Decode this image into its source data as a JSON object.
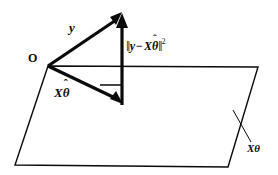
{
  "figure": {
    "background_color": "#ffffff",
    "ink_color": "#0a0a0a",
    "width": 278,
    "height": 175,
    "labels": {
      "origin": "O",
      "vector_y": "y",
      "vector_x_theta_hat_X": "X",
      "vector_x_theta_hat_theta": "θ",
      "vector_x_theta_hat_hat": "ˆ",
      "plane_label_X": "X",
      "plane_label_theta": "θ",
      "residual_open_bar": "‖",
      "residual_y": "y",
      "residual_minus": "−",
      "residual_X": "X",
      "residual_theta": "θ",
      "residual_hat": "ˆ",
      "residual_close_bar": "‖",
      "residual_exponent": "2"
    },
    "geometry": {
      "origin_point": [
        48,
        66
      ],
      "y_tip": [
        122,
        12
      ],
      "projection_tip": [
        122,
        105
      ],
      "residual_top": [
        122,
        16
      ],
      "plane_corners": [
        [
          48,
          66
        ],
        [
          258,
          67
        ],
        [
          228,
          167
        ],
        [
          15,
          165
        ]
      ],
      "right_angle_marker": [
        [
          100,
          85
        ],
        [
          122,
          85
        ],
        [
          122,
          105
        ]
      ],
      "leader_line": [
        [
          233,
          110
        ],
        [
          251,
          142
        ]
      ]
    },
    "stroke_widths": {
      "vector": 3.2,
      "plane": 1.4,
      "right_angle": 1.6,
      "leader": 1.0
    }
  }
}
